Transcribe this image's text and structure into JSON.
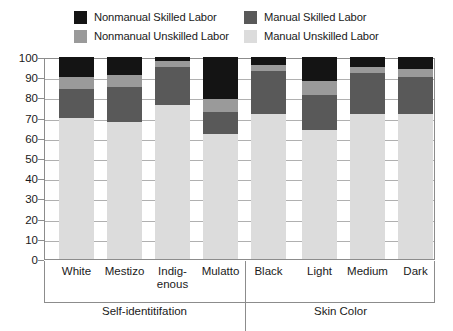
{
  "chart_data": {
    "type": "bar",
    "subtype": "stacked-bar-100",
    "title": "",
    "xlabel": "",
    "ylabel": "",
    "ylim": [
      0,
      100
    ],
    "ytick_step": 10,
    "yticks": [
      "100",
      "90",
      "80",
      "70",
      "60",
      "50",
      "40",
      "30",
      "20",
      "10",
      "0"
    ],
    "grid": true,
    "legend_position": "top",
    "categories": [
      "White",
      "Mestizo",
      "Indig-\nenous",
      "Mulatto",
      "Black",
      "Light",
      "Medium",
      "Dark"
    ],
    "category_labels": [
      {
        "line1": "White",
        "line2": ""
      },
      {
        "line1": "Mestizo",
        "line2": ""
      },
      {
        "line1": "Indig-",
        "line2": "enous"
      },
      {
        "line1": "Mulatto",
        "line2": ""
      },
      {
        "line1": "Black",
        "line2": ""
      },
      {
        "line1": "Light",
        "line2": ""
      },
      {
        "line1": "Medium",
        "line2": ""
      },
      {
        "line1": "Dark",
        "line2": ""
      }
    ],
    "groups": [
      {
        "name": "Self-identitifation",
        "categories": [
          "White",
          "Mestizo",
          "Indig-enous",
          "Mulatto",
          "Black"
        ]
      },
      {
        "name": "Skin Color",
        "categories": [
          "Light",
          "Medium",
          "Dark"
        ]
      }
    ],
    "series": [
      {
        "name": "Manual Unskilled Labor",
        "color": "#dcdcdc",
        "values": [
          70,
          68,
          76,
          62,
          72,
          64,
          72,
          72
        ]
      },
      {
        "name": "Manual Skilled Labor",
        "color": "#595959",
        "values": [
          14,
          17,
          19,
          11,
          21,
          17,
          20,
          18
        ]
      },
      {
        "name": "Nonmanual Unskilled Labor",
        "color": "#9a9a9a",
        "values": [
          6,
          6,
          3,
          6,
          3,
          7,
          3,
          4
        ]
      },
      {
        "name": "Nonmanual Skilled Labor",
        "color": "#141414",
        "values": [
          10,
          9,
          2,
          21,
          4,
          12,
          5,
          6
        ]
      }
    ]
  },
  "legend": {
    "items": [
      {
        "label": "Nonmanual Skilled Labor",
        "color": "#141414",
        "swatch": "legend-swatch-nonmanual-skilled"
      },
      {
        "label": "Manual Skilled Labor",
        "color": "#595959",
        "swatch": "legend-swatch-manual-skilled"
      },
      {
        "label": "Nonmanual Unskilled Labor",
        "color": "#9a9a9a",
        "swatch": "legend-swatch-nonmanual-unskilled"
      },
      {
        "label": "Manual Unskilled Labor",
        "color": "#dcdcdc",
        "swatch": "legend-swatch-manual-unskilled"
      }
    ]
  },
  "colors": {
    "nonmanual_skilled": "#141414",
    "manual_skilled": "#595959",
    "nonmanual_unskilled": "#9a9a9a",
    "manual_unskilled": "#dcdcdc",
    "axis": "#8c8c8c",
    "grid": "#b0b0b0",
    "text": "#1a1a1a",
    "background": "#ffffff"
  }
}
